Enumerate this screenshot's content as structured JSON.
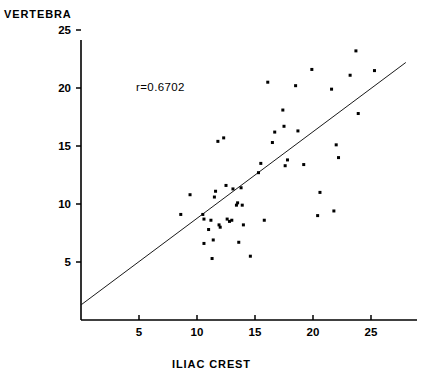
{
  "title": "VERTEBRA",
  "xaxis_title": "ILIAC CREST",
  "annotation": "r=0.6702",
  "chart_data": {
    "type": "scatter",
    "title": "VERTEBRA",
    "xlabel": "ILIAC CREST",
    "ylabel": "VERTEBRA",
    "xlim": [
      0,
      29.5
    ],
    "ylim": [
      0,
      25.8
    ],
    "xticks": [
      5,
      10,
      15,
      20,
      25
    ],
    "yticks": [
      5,
      10,
      15,
      20,
      25
    ],
    "xtick_labels": [
      "5",
      "10",
      "15",
      "20",
      "25"
    ],
    "ytick_labels": [
      "5",
      "10",
      "15",
      "20",
      "25"
    ],
    "grid": false,
    "legend": false,
    "annotations": [
      {
        "text": "r=0.6702",
        "x": 9.5,
        "y": 20.6
      }
    ],
    "correlation": 0.6702,
    "regression_line": {
      "x": [
        0.0,
        28.0
      ],
      "y": [
        1.3,
        22.2
      ],
      "slope": 0.746,
      "intercept": 1.3
    },
    "marker": "square",
    "marker_color": "#000000",
    "marker_size": 3,
    "points": [
      {
        "x": 8.6,
        "y": 9.1
      },
      {
        "x": 9.4,
        "y": 10.8
      },
      {
        "x": 10.5,
        "y": 9.1
      },
      {
        "x": 10.6,
        "y": 8.7
      },
      {
        "x": 10.6,
        "y": 6.6
      },
      {
        "x": 11.0,
        "y": 7.8
      },
      {
        "x": 11.2,
        "y": 8.6
      },
      {
        "x": 11.3,
        "y": 5.3
      },
      {
        "x": 11.4,
        "y": 6.9
      },
      {
        "x": 11.5,
        "y": 10.6
      },
      {
        "x": 11.6,
        "y": 11.1
      },
      {
        "x": 11.8,
        "y": 15.4
      },
      {
        "x": 11.9,
        "y": 8.2
      },
      {
        "x": 12.0,
        "y": 8.0
      },
      {
        "x": 12.3,
        "y": 15.7
      },
      {
        "x": 12.5,
        "y": 11.6
      },
      {
        "x": 12.6,
        "y": 8.7
      },
      {
        "x": 12.8,
        "y": 8.5
      },
      {
        "x": 13.0,
        "y": 8.6
      },
      {
        "x": 13.1,
        "y": 11.3
      },
      {
        "x": 13.4,
        "y": 9.9
      },
      {
        "x": 13.5,
        "y": 10.1
      },
      {
        "x": 13.6,
        "y": 6.7
      },
      {
        "x": 13.8,
        "y": 11.4
      },
      {
        "x": 13.9,
        "y": 9.9
      },
      {
        "x": 14.0,
        "y": 8.2
      },
      {
        "x": 14.6,
        "y": 5.5
      },
      {
        "x": 15.3,
        "y": 12.7
      },
      {
        "x": 15.5,
        "y": 13.5
      },
      {
        "x": 15.8,
        "y": 8.6
      },
      {
        "x": 16.1,
        "y": 20.5
      },
      {
        "x": 16.5,
        "y": 15.3
      },
      {
        "x": 16.7,
        "y": 16.2
      },
      {
        "x": 17.4,
        "y": 18.1
      },
      {
        "x": 17.5,
        "y": 16.7
      },
      {
        "x": 17.6,
        "y": 13.3
      },
      {
        "x": 17.8,
        "y": 13.8
      },
      {
        "x": 18.5,
        "y": 20.2
      },
      {
        "x": 18.7,
        "y": 16.3
      },
      {
        "x": 19.2,
        "y": 13.4
      },
      {
        "x": 19.9,
        "y": 21.6
      },
      {
        "x": 20.4,
        "y": 9.0
      },
      {
        "x": 20.6,
        "y": 11.0
      },
      {
        "x": 21.6,
        "y": 19.9
      },
      {
        "x": 21.8,
        "y": 9.4
      },
      {
        "x": 22.0,
        "y": 15.1
      },
      {
        "x": 22.2,
        "y": 14.0
      },
      {
        "x": 23.2,
        "y": 21.1
      },
      {
        "x": 23.7,
        "y": 23.2
      },
      {
        "x": 23.9,
        "y": 17.8
      },
      {
        "x": 25.3,
        "y": 21.5
      }
    ]
  }
}
